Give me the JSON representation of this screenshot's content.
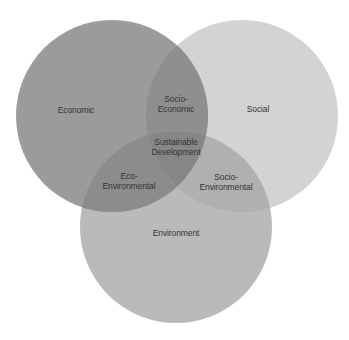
{
  "diagram": {
    "type": "venn",
    "background": "#ffffff",
    "circles": [
      {
        "id": "economic",
        "label": "Economic",
        "cx": 112,
        "cy": 116,
        "r": 96,
        "color": "#9b9b9b"
      },
      {
        "id": "social",
        "label": "Social",
        "cx": 242,
        "cy": 116,
        "r": 96,
        "color": "#d3d3d3"
      },
      {
        "id": "environment",
        "label": "Environment",
        "cx": 176,
        "cy": 227,
        "r": 96,
        "color": "#bababa"
      }
    ],
    "overlap_colors": {
      "economic_social": "#8f8f8f",
      "economic_environment": "#8c8c8c",
      "social_environment": "#b0b0b0",
      "all_three": "#868686"
    },
    "labels": {
      "economic": "Economic",
      "social": "Social",
      "environment": "Environment",
      "socio_economic": "Socio-\nEconomic",
      "eco_environmental": "Eco-\nEnvironmental",
      "socio_environmental": "Socio-\nEnvironmental",
      "sustainable_development": "Sustainable\nDevelopment"
    }
  }
}
